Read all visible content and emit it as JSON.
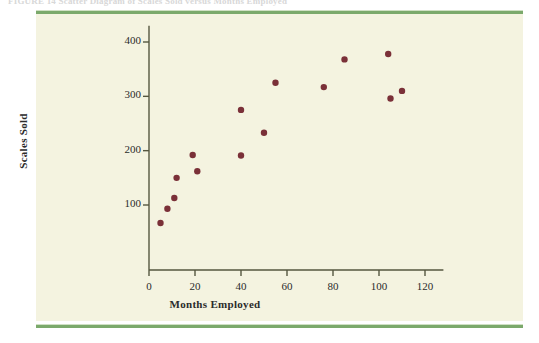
{
  "caption": "FIGURE 14   Scatter Diagram of Scales Sold versus Months Employed",
  "colors": {
    "page_background": "#ffffff",
    "panel_background": "#f4f3e0",
    "rule_green": "#7ba96b",
    "marker": "#7a3038",
    "axis": "#55563f",
    "text": "#2b2b2b"
  },
  "chart_data": {
    "type": "scatter",
    "title": "",
    "xlabel": "Months Employed",
    "ylabel": "Scales Sold",
    "xlim": [
      0,
      128
    ],
    "ylim": [
      0,
      430
    ],
    "xticks": [
      0,
      20,
      40,
      60,
      80,
      100,
      120
    ],
    "yticks": [
      100,
      200,
      300,
      400
    ],
    "grid": false,
    "legend": null,
    "marker_shape": "circle",
    "marker_color": "#7a3038",
    "points": [
      {
        "x": 5,
        "y": 67
      },
      {
        "x": 8,
        "y": 93
      },
      {
        "x": 11,
        "y": 113
      },
      {
        "x": 12,
        "y": 150
      },
      {
        "x": 19,
        "y": 192
      },
      {
        "x": 21,
        "y": 162
      },
      {
        "x": 40,
        "y": 191
      },
      {
        "x": 40,
        "y": 275
      },
      {
        "x": 50,
        "y": 233
      },
      {
        "x": 55,
        "y": 325
      },
      {
        "x": 76,
        "y": 317
      },
      {
        "x": 85,
        "y": 368
      },
      {
        "x": 104,
        "y": 378
      },
      {
        "x": 105,
        "y": 296
      },
      {
        "x": 110,
        "y": 310
      }
    ]
  }
}
